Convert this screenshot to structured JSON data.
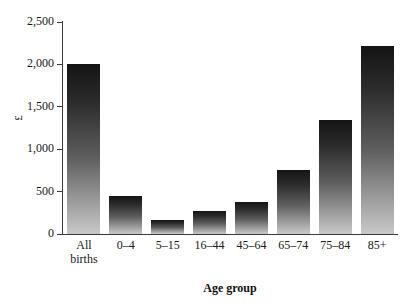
{
  "chart_data": {
    "type": "bar",
    "title": "",
    "subtitle": "",
    "xlabel": "Age group",
    "ylabel": "£",
    "categories": [
      "All\nbirths",
      "0–4",
      "5–15",
      "16–44",
      "45–64",
      "65–74",
      "75–84",
      "85+"
    ],
    "values": [
      2000,
      450,
      160,
      270,
      380,
      750,
      1350,
      2220
    ],
    "ylim": [
      0,
      2500
    ],
    "yticks": [
      0,
      500,
      1000,
      1500,
      2000,
      2500
    ],
    "ytick_labels": [
      "0",
      "500",
      "1,000",
      "1,500",
      "2,000",
      "2,500"
    ],
    "grid": false,
    "legend": null,
    "legend_position": "none",
    "annotations": []
  },
  "style": {
    "bar_top_color": "#141414",
    "bar_bottom_color": "#c9c9c9",
    "axis_color": "#3a3a3a",
    "text_color": "#1a1a1a",
    "background": "#ffffff"
  }
}
